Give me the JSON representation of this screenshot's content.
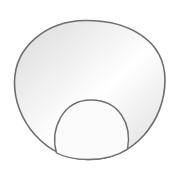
{
  "diagram": {
    "width": 183,
    "height": 175,
    "outer_shape": {
      "label": "",
      "stroke": "#6e6e6e",
      "fill_light": "#ffffff",
      "fill_dark": "#d9d9d9",
      "path": "M 85 20.5 C 128 20, 165 40, 165 80 C 165 120, 135 160, 88 159.5 C 45 159, 14 120, 14.5 82 C 15 45, 48 21, 85 20.5 Z"
    },
    "inner_dome": {
      "label": "",
      "stroke": "#6e6e6e",
      "fill": "#fbfbfb",
      "path": "M 56.5 153 C 50 130, 62 100, 91 100 C 120 100, 132 125, 127.5 149 C 115 157.5, 100 159.5, 88 159.5 C 76 159.5, 64 157, 56.5 153 Z"
    },
    "stroke_width": 1.6
  }
}
